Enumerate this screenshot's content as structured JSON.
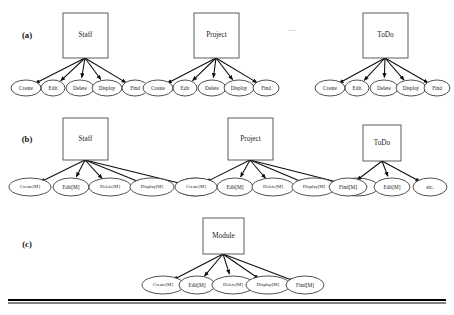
{
  "figure": {
    "title_present": false,
    "background_color": "#ffffff",
    "line_color": "#000000",
    "node_stroke_color": "#3d3d3d",
    "width": 454,
    "height": 315
  },
  "rows": [
    {
      "label": "(a)",
      "label_x": 27,
      "label_y": 36,
      "clusters": [
        {
          "name": "staff-cluster-a",
          "box": {
            "label": "Staff",
            "x": 63,
            "y": 13,
            "w": 45,
            "h": 45
          },
          "hub": {
            "x": 85,
            "y": 58
          },
          "children": [
            {
              "label": "Create",
              "cx": 26,
              "cy": 88,
              "rx": 15,
              "ry": 8
            },
            {
              "label": "Edit",
              "cx": 53,
              "cy": 88,
              "rx": 12,
              "ry": 8
            },
            {
              "label": "Delete",
              "cx": 80,
              "cy": 88,
              "rx": 14,
              "ry": 8
            },
            {
              "label": "Display",
              "cx": 107,
              "cy": 88,
              "rx": 15,
              "ry": 8
            },
            {
              "label": "Find",
              "cx": 135,
              "cy": 88,
              "rx": 13,
              "ry": 8
            }
          ]
        },
        {
          "name": "project-cluster-a",
          "box": {
            "label": "Project",
            "x": 194,
            "y": 13,
            "w": 45,
            "h": 45
          },
          "hub": {
            "x": 216,
            "y": 58
          },
          "children": [
            {
              "label": "Create",
              "cx": 158,
              "cy": 88,
              "rx": 15,
              "ry": 8
            },
            {
              "label": "Edit",
              "cx": 185,
              "cy": 88,
              "rx": 12,
              "ry": 8
            },
            {
              "label": "Delete",
              "cx": 212,
              "cy": 88,
              "rx": 14,
              "ry": 8
            },
            {
              "label": "Display",
              "cx": 239,
              "cy": 88,
              "rx": 15,
              "ry": 8
            },
            {
              "label": "Find",
              "cx": 266,
              "cy": 88,
              "rx": 13,
              "ry": 8
            }
          ]
        },
        {
          "name": "todo-cluster-a",
          "box": {
            "label": "ToDo",
            "x": 363,
            "y": 13,
            "w": 45,
            "h": 45
          },
          "hub": {
            "x": 385,
            "y": 58
          },
          "children": [
            {
              "label": "Create",
              "cx": 330,
              "cy": 88,
              "rx": 15,
              "ry": 8
            },
            {
              "label": "Edit",
              "cx": 357,
              "cy": 88,
              "rx": 12,
              "ry": 8
            },
            {
              "label": "Delete",
              "cx": 384,
              "cy": 88,
              "rx": 14,
              "ry": 8
            },
            {
              "label": "Display",
              "cx": 411,
              "cy": 88,
              "rx": 15,
              "ry": 8
            },
            {
              "label": "Find",
              "cx": 437,
              "cy": 88,
              "rx": 13,
              "ry": 8
            }
          ]
        }
      ],
      "ellipsis": {
        "text": "...",
        "x": 292,
        "y": 29
      }
    },
    {
      "label": "(b)",
      "label_x": 27,
      "label_y": 140,
      "clusters": [
        {
          "name": "staff-cluster-b",
          "box": {
            "label": "Staff",
            "x": 63,
            "y": 118,
            "w": 45,
            "h": 42
          },
          "hub": {
            "x": 85,
            "y": 160
          },
          "children": [
            {
              "label": "Create[M]",
              "cx": 30,
              "cy": 187,
              "rx": 21,
              "ry": 9
            },
            {
              "label": "Edit[M]",
              "cx": 71,
              "cy": 187,
              "rx": 18,
              "ry": 9
            },
            {
              "label": "Delete[M]",
              "cx": 110,
              "cy": 187,
              "rx": 21,
              "ry": 9
            },
            {
              "label": "Display[M]",
              "cx": 152,
              "cy": 187,
              "rx": 22,
              "ry": 9
            },
            {
              "label": "Find[M]",
              "cx": 195,
              "cy": 187,
              "rx": 19,
              "ry": 9
            }
          ]
        },
        {
          "name": "project-cluster-b",
          "box": {
            "label": "Project",
            "x": 228,
            "y": 118,
            "w": 45,
            "h": 42
          },
          "hub": {
            "x": 250,
            "y": 160
          },
          "children": [
            {
              "label": "Create[M]",
              "cx": 196,
              "cy": 187,
              "rx": 21,
              "ry": 9
            },
            {
              "label": "Edit[M]",
              "cx": 235,
              "cy": 187,
              "rx": 18,
              "ry": 9
            },
            {
              "label": "Delete[M]",
              "cx": 273,
              "cy": 187,
              "rx": 21,
              "ry": 9
            },
            {
              "label": "Display[M]",
              "cx": 314,
              "cy": 187,
              "rx": 22,
              "ry": 9
            },
            {
              "label": "Create[M]",
              "cx": 357,
              "cy": 187,
              "rx": 21,
              "ry": 9
            }
          ]
        },
        {
          "name": "todo-cluster-b",
          "box": {
            "label": "ToDo",
            "x": 363,
            "y": 125,
            "w": 38,
            "h": 36
          },
          "hub": {
            "x": 382,
            "y": 161
          },
          "children": [
            {
              "label": "Find[M]",
              "cx": 348,
              "cy": 187,
              "rx": 19,
              "ry": 9
            },
            {
              "label": "Edit[M]",
              "cx": 392,
              "cy": 187,
              "rx": 18,
              "ry": 9
            },
            {
              "label": "etc.",
              "cx": 430,
              "cy": 187,
              "rx": 17,
              "ry": 9
            }
          ]
        }
      ],
      "ellipsis": null
    },
    {
      "label": "(c)",
      "label_x": 27,
      "label_y": 245,
      "clusters": [
        {
          "name": "module-cluster-c",
          "box": {
            "label": "Module",
            "x": 203,
            "y": 218,
            "w": 41,
            "h": 36
          },
          "hub": {
            "x": 223,
            "y": 254
          },
          "children": [
            {
              "label": "Create[M]",
              "cx": 163,
              "cy": 285,
              "rx": 21,
              "ry": 9
            },
            {
              "label": "Edit[M]",
              "cx": 197,
              "cy": 285,
              "rx": 18,
              "ry": 9
            },
            {
              "label": "Delete[M]",
              "cx": 233,
              "cy": 285,
              "rx": 21,
              "ry": 9
            },
            {
              "label": "Display[M]",
              "cx": 268,
              "cy": 285,
              "rx": 22,
              "ry": 9
            },
            {
              "label": "Find[M]",
              "cx": 305,
              "cy": 285,
              "rx": 19,
              "ry": 9
            }
          ]
        }
      ],
      "ellipsis": null
    }
  ],
  "footer_rule": {
    "name": "bottom-rule",
    "x1": 8,
    "x2": 446,
    "y_top": 300,
    "y_bottom": 303,
    "thickness_top": 2.2,
    "thickness_bottom": 1.2
  }
}
